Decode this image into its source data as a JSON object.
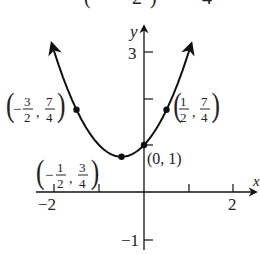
{
  "header": {
    "partial_formula_text": "(     2)      4"
  },
  "chart_data": {
    "type": "line",
    "title": "",
    "function": "y = x^2 + x + 1",
    "xlabel": "x",
    "ylabel": "y",
    "xlim": [
      -2.3,
      2.5
    ],
    "ylim": [
      -1.3,
      3.4
    ],
    "grid": false,
    "x_ticks": [
      -2,
      -1,
      1,
      2
    ],
    "x_tick_labels": [
      "-2",
      "2"
    ],
    "y_ticks": [
      3,
      -1
    ],
    "y_tick_labels": [
      "3",
      "-1"
    ],
    "series": [
      {
        "name": "parabola",
        "x": [
          -1.9,
          -1.5,
          -1.0,
          -0.5,
          0.0,
          0.5,
          0.9
        ],
        "y": [
          2.71,
          1.75,
          1.0,
          0.75,
          1.0,
          1.75,
          2.71
        ]
      }
    ],
    "points": [
      {
        "x": -1.5,
        "y": 1.75,
        "label_num_x": "3",
        "label_den_x": "2",
        "label_num_y": "7",
        "label_den_y": "4",
        "label_sign_x": "−",
        "label": "(-3/2, 7/4)"
      },
      {
        "x": 0.5,
        "y": 1.75,
        "label_num_x": "1",
        "label_den_x": "2",
        "label_num_y": "7",
        "label_den_y": "4",
        "label_sign_x": "",
        "label": "(1/2, 7/4)"
      },
      {
        "x": -0.5,
        "y": 0.75,
        "label_num_x": "1",
        "label_den_x": "2",
        "label_num_y": "3",
        "label_den_y": "4",
        "label_sign_x": "−",
        "label": "(-1/2, 3/4)"
      },
      {
        "x": 0,
        "y": 1,
        "label": "(0, 1)"
      }
    ],
    "annotations": [
      "(-3/2, 7/4)",
      "(1/2, 7/4)",
      "(-1/2, 3/4)",
      "(0, 1)"
    ]
  },
  "labels": {
    "y_axis": "y",
    "x_axis": "x",
    "tick_neg2": "−2",
    "tick_2": "2",
    "tick_3": "3",
    "tick_neg1": "−1",
    "p00": "(0, 1)",
    "minus": "−",
    "comma": ",",
    "p1": {
      "sign": "−",
      "nx": "3",
      "dx": "2",
      "ny": "7",
      "dy": "4"
    },
    "p2": {
      "sign": "",
      "nx": "1",
      "dx": "2",
      "ny": "7",
      "dy": "4"
    },
    "p3": {
      "sign": "−",
      "nx": "1",
      "dx": "2",
      "ny": "3",
      "dy": "4"
    }
  }
}
